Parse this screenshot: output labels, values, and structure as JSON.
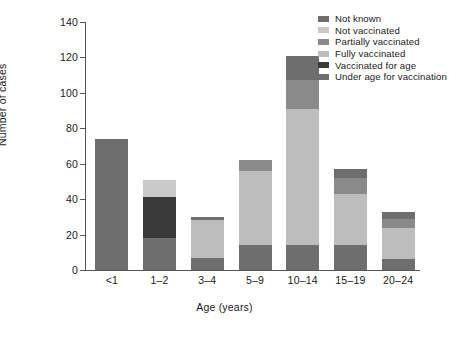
{
  "chart_data": {
    "type": "bar",
    "subtype": "stacked-bar",
    "title": "",
    "xlabel": "Age (years)",
    "ylabel": "Number of cases",
    "categories": [
      "<1",
      "1–2",
      "3–4",
      "5–9",
      "10–14",
      "15–19",
      "20–24"
    ],
    "ylim": [
      0,
      140
    ],
    "yticks": [
      0,
      20,
      40,
      60,
      80,
      100,
      120,
      140
    ],
    "grid": false,
    "legend_position": "top-right",
    "series": [
      {
        "name": "Not known",
        "color": "#6e6e6e",
        "values": [
          0,
          0,
          2,
          0,
          14,
          5,
          4
        ]
      },
      {
        "name": "Not vaccinated",
        "color": "#c9c9c9",
        "values": [
          0,
          10,
          0,
          0,
          0,
          0,
          0
        ]
      },
      {
        "name": "Partially vaccinated",
        "color": "#8a8a8a",
        "values": [
          0,
          0,
          0,
          6,
          16,
          9,
          5
        ]
      },
      {
        "name": "Fully vaccinated",
        "color": "#bdbdbd",
        "values": [
          0,
          0,
          21,
          42,
          77,
          29,
          18
        ]
      },
      {
        "name": "Vaccinated for age",
        "color": "#3a3a3a",
        "values": [
          0,
          23,
          0,
          0,
          0,
          0,
          0
        ]
      },
      {
        "name": "Under age for vaccination",
        "color": "#6e6e6e",
        "values": [
          74,
          18,
          7,
          14,
          14,
          14,
          6
        ]
      }
    ],
    "totals": [
      74,
      51,
      30,
      62,
      121,
      57,
      33
    ],
    "stack_order_bottom_to_top": [
      "Under age for vaccination",
      "Vaccinated for age",
      "Fully vaccinated",
      "Partially vaccinated",
      "Not vaccinated",
      "Not known"
    ]
  },
  "legend": {
    "items": [
      {
        "label": "Not known",
        "color": "#6e6e6e"
      },
      {
        "label": "Not vaccinated",
        "color": "#c9c9c9"
      },
      {
        "label": "Partially vaccinated",
        "color": "#8a8a8a"
      },
      {
        "label": "Fully vaccinated",
        "color": "#bdbdbd"
      },
      {
        "label": "Vaccinated for age",
        "color": "#3a3a3a"
      },
      {
        "label": "Under age for vaccination",
        "color": "#6e6e6e"
      }
    ]
  },
  "colors": {
    "axis": "#555555",
    "text": "#1a1a1a",
    "background": "#ffffff"
  }
}
